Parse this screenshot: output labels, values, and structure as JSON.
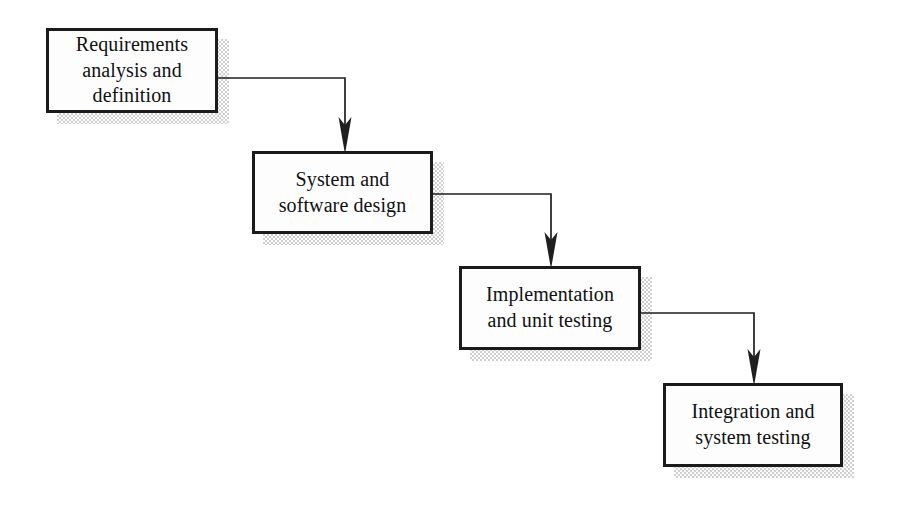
{
  "diagram": {
    "type": "flowchart",
    "orientation": "cascading-down-right",
    "background_color": "#ffffff",
    "box_fill_color": "#fdfdfd",
    "box_border_color": "#1b1b1b",
    "shadow_color": "#cfcfcf",
    "line_color": "#1f1f1f",
    "stages": [
      {
        "id": "requirements",
        "label": "Requirements\nanalysis and\ndefinition",
        "x": 46,
        "y": 28,
        "width": 172,
        "height": 85
      },
      {
        "id": "design",
        "label": "System and\nsoftware design",
        "x": 252,
        "y": 151,
        "width": 181,
        "height": 83
      },
      {
        "id": "implementation",
        "label": "Implementation\nand unit testing",
        "x": 459,
        "y": 266,
        "width": 182,
        "height": 84
      },
      {
        "id": "integration",
        "label": "Integration and\nsystem testing",
        "x": 663,
        "y": 383,
        "width": 180,
        "height": 84
      }
    ],
    "connectors": [
      {
        "id": "requirements-to-design",
        "from": "requirements",
        "to": "design",
        "from_x": 218,
        "from_y": 78,
        "corner_x": 345,
        "to_x": 345,
        "to_y": 151
      },
      {
        "id": "design-to-implementation",
        "from": "design",
        "to": "implementation",
        "from_x": 433,
        "from_y": 194,
        "corner_x": 551,
        "to_x": 551,
        "to_y": 266
      },
      {
        "id": "implementation-to-integration",
        "from": "implementation",
        "to": "integration",
        "from_x": 641,
        "from_y": 313,
        "corner_x": 754,
        "to_x": 754,
        "to_y": 383
      }
    ]
  }
}
